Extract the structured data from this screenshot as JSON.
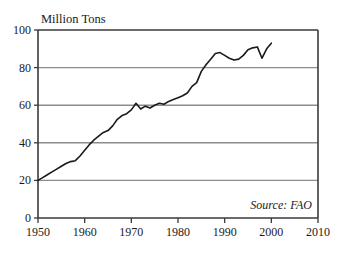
{
  "chart_data": {
    "type": "line",
    "title": "",
    "ylabel": "Million Tons",
    "xlabel": "",
    "xlim": [
      1950,
      2010
    ],
    "ylim": [
      0,
      100
    ],
    "xticks": [
      1950,
      1960,
      1970,
      1980,
      1990,
      2000,
      2010
    ],
    "yticks": [
      0,
      20,
      40,
      60,
      80,
      100
    ],
    "xtick_labels": [
      "1950",
      "1960",
      "1970",
      "1980",
      "1990",
      "2000",
      "2010"
    ],
    "ytick_labels": [
      "0",
      "20",
      "40",
      "60",
      "80",
      "100"
    ],
    "grid": "horizontal",
    "legend": "none",
    "annotations": [
      {
        "name": "source",
        "text": "Source: FAO",
        "position": "bottom-right-inside"
      }
    ],
    "colors": {
      "line": "#1a1a1a",
      "grid": "#8c8c8c",
      "frame": "#3a3a3a",
      "background": "#ffffff"
    },
    "series": [
      {
        "name": "production",
        "x": [
          1950,
          1951,
          1952,
          1953,
          1954,
          1955,
          1956,
          1957,
          1958,
          1959,
          1960,
          1961,
          1962,
          1963,
          1964,
          1965,
          1966,
          1967,
          1968,
          1969,
          1970,
          1971,
          1972,
          1973,
          1974,
          1975,
          1976,
          1977,
          1978,
          1979,
          1980,
          1981,
          1982,
          1983,
          1984,
          1985,
          1986,
          1987,
          1988,
          1989,
          1990,
          1991,
          1992,
          1993,
          1994,
          1995,
          1996,
          1997,
          1998,
          1999,
          2000
        ],
        "values": [
          20.0,
          21.5,
          23.0,
          24.5,
          26.0,
          27.5,
          29.0,
          30.0,
          30.5,
          33.0,
          36.0,
          39.0,
          41.5,
          43.5,
          45.5,
          46.5,
          49.0,
          52.5,
          54.5,
          55.5,
          57.5,
          61.0,
          58.0,
          59.5,
          58.5,
          60.0,
          61.0,
          60.5,
          62.0,
          63.0,
          64.0,
          65.0,
          66.5,
          70.0,
          72.0,
          78.0,
          81.5,
          84.5,
          87.5,
          88.0,
          86.5,
          85.0,
          84.0,
          84.5,
          86.5,
          89.5,
          90.5,
          91.0,
          85.0,
          90.0,
          93.0
        ]
      }
    ]
  },
  "plot_geometry": {
    "left": 38,
    "right": 318,
    "top": 30,
    "bottom": 218
  }
}
